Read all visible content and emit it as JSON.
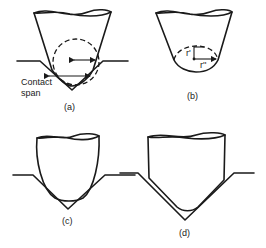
{
  "figure": {
    "panels": [
      {
        "id": "a",
        "caption": "(a)",
        "labels": {
          "contact_span": "Contact span"
        }
      },
      {
        "id": "b",
        "caption": "(b)",
        "labels": {
          "r_prime": "r'",
          "r_double_prime": "r''"
        }
      },
      {
        "id": "c",
        "caption": "(c)"
      },
      {
        "id": "d",
        "caption": "(d)"
      }
    ]
  }
}
